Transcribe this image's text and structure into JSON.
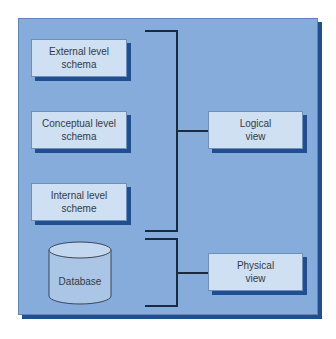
{
  "diagram": {
    "title": "",
    "colors": {
      "panel": "#86acdb",
      "shadow": "#1f4f91",
      "box_fill": "#cfe0f3",
      "line": "#1c2a3e",
      "text": "#333a45"
    },
    "schema_boxes": [
      {
        "line1": "External level",
        "line2": "schema"
      },
      {
        "line1": "Conceptual level",
        "line2": "schema"
      },
      {
        "line1": "Internal level",
        "line2": "scheme"
      }
    ],
    "database": {
      "label": "Database"
    },
    "views": [
      {
        "line1": "Logical",
        "line2": "view"
      },
      {
        "line1": "Physical",
        "line2": "view"
      }
    ],
    "groupings": [
      {
        "from": [
          "External level schema",
          "Conceptual level schema",
          "Internal level scheme"
        ],
        "to": "Logical view"
      },
      {
        "from": [
          "Database"
        ],
        "to": "Physical view"
      }
    ]
  }
}
